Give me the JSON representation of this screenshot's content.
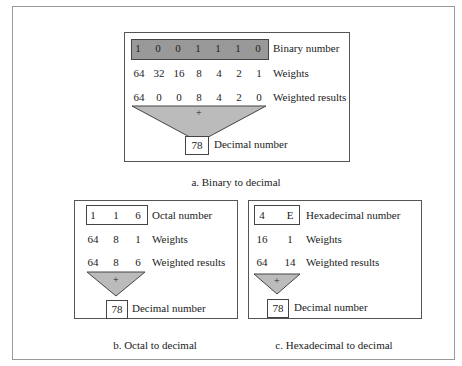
{
  "panel_a": {
    "binary_digits": [
      "1",
      "0",
      "0",
      "1",
      "1",
      "1",
      "0"
    ],
    "weights": [
      "64",
      "32",
      "16",
      "8",
      "4",
      "2",
      "1"
    ],
    "weighted_results": [
      "64",
      "0",
      "0",
      "8",
      "4",
      "2",
      "0"
    ],
    "labels": {
      "number": "Binary number",
      "weights": "Weights",
      "results": "Weighted results",
      "decimal": "Decimal number"
    },
    "plus": "+",
    "decimal_value": "78",
    "caption": "a. Binary to decimal"
  },
  "panel_b": {
    "digits": [
      "1",
      "1",
      "6"
    ],
    "weights": [
      "64",
      "8",
      "1"
    ],
    "weighted_results": [
      "64",
      "8",
      "6"
    ],
    "labels": {
      "number": "Octal number",
      "weights": "Weights",
      "results": "Weighted results",
      "decimal": "Decimal number"
    },
    "plus": "+",
    "decimal_value": "78",
    "caption": "b. Octal to decimal"
  },
  "panel_c": {
    "digits": [
      "4",
      "E"
    ],
    "weights": [
      "16",
      "1"
    ],
    "weighted_results": [
      "64",
      "14"
    ],
    "labels": {
      "number": "Hexadecimal number",
      "weights": "Weights",
      "results": "Weighted results",
      "decimal": "Decimal number"
    },
    "plus": "+",
    "decimal_value": "78",
    "caption": "c. Hexadecimal to decimal"
  }
}
